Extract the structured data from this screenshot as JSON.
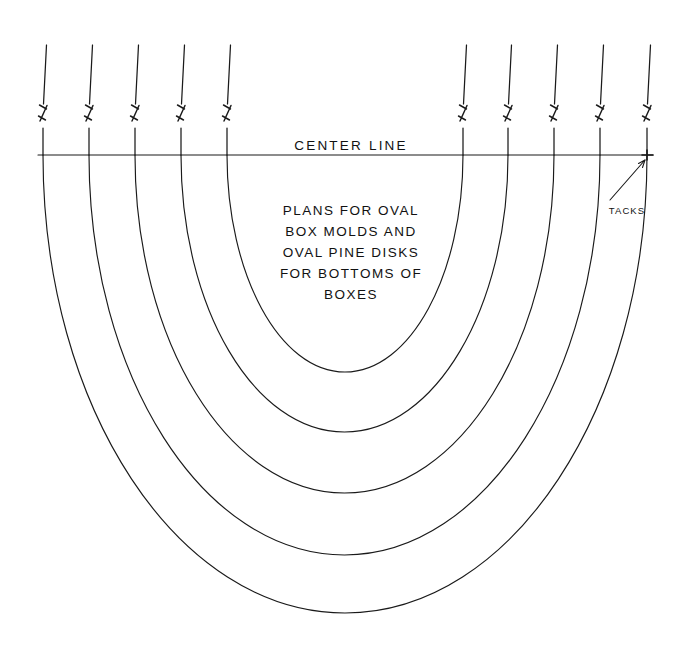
{
  "sheet": {
    "width": 689,
    "height": 646,
    "background": "#ffffff",
    "ink_color": "#1a1a1a"
  },
  "labels": {
    "center_line": "CENTER LINE",
    "tacks": "TACKS",
    "note_lines": [
      "PLANS FOR OVAL",
      "BOX MOLDS AND",
      "OVAL PINE DISKS",
      "FOR BOTTOMS OF",
      "BOXES"
    ]
  },
  "geometry": {
    "focal_point": {
      "x": 647,
      "y": 155
    },
    "center_line": {
      "x1": 38,
      "x2": 653,
      "y": 155
    },
    "verticals_left_x": [
      43,
      89,
      135,
      181,
      227
    ],
    "verticals_right_x": [
      463,
      508,
      554,
      600,
      647
    ],
    "vertical_top_y": 45,
    "vertical_break_y": 112,
    "arc_bottom_y": [
      372,
      432,
      493,
      555,
      613
    ],
    "arc_count": 5,
    "tack_count": 10,
    "leader": {
      "x1": 610,
      "y1": 200,
      "x2": 645,
      "y2": 160
    }
  },
  "arcs": [
    {
      "name": "arc-1-innermost",
      "left_x": 227,
      "right_x": 463,
      "bottom_y": 372
    },
    {
      "name": "arc-2",
      "left_x": 181,
      "right_x": 508,
      "bottom_y": 432
    },
    {
      "name": "arc-3",
      "left_x": 135,
      "right_x": 554,
      "bottom_y": 493
    },
    {
      "name": "arc-4",
      "left_x": 89,
      "right_x": 600,
      "bottom_y": 555
    },
    {
      "name": "arc-5-outermost",
      "left_x": 43,
      "right_x": 647,
      "bottom_y": 613
    }
  ],
  "note_block": {
    "center_x": 351,
    "first_line_y": 211,
    "line_height": 21
  }
}
